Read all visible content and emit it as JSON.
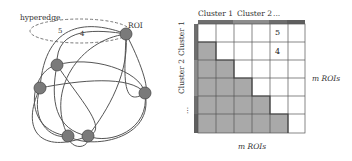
{
  "left_diagram": {
    "hyperedge_label": "hyperedge",
    "roi_label": "ROI",
    "edge_weights": [
      "5",
      "4"
    ],
    "nodes": [
      {
        "id": "roi-top-right",
        "x": 126,
        "y": 34
      },
      {
        "id": "node-upper-left",
        "x": 57,
        "y": 65
      },
      {
        "id": "node-left",
        "x": 40,
        "y": 88
      },
      {
        "id": "node-right",
        "x": 145,
        "y": 93
      },
      {
        "id": "node-bottom-left",
        "x": 68,
        "y": 136
      },
      {
        "id": "node-bottom-right",
        "x": 88,
        "y": 136
      }
    ],
    "colors": {
      "node_fill": "#7a7a7a",
      "edge": "#555555",
      "hyperedge_dash": "#777777"
    }
  },
  "right_diagram": {
    "col_headers": [
      "Cluster 1",
      "Cluster 2",
      "..."
    ],
    "row_headers": [
      "Cluster 1",
      "Cluster 2",
      "..."
    ],
    "x_axis_label": "m ROIs",
    "y_axis_label": "m ROIs",
    "matrix_size": 6,
    "cell_values": [
      {
        "row": 0,
        "col": 4,
        "value": "5"
      },
      {
        "row": 1,
        "col": 4,
        "value": "4"
      }
    ],
    "colors": {
      "lower_triangle": "#a9a9a9",
      "upper_triangle": "#ffffff",
      "grid": "#555555",
      "cluster_bar_1": "#6e6e6e",
      "cluster_bar_2": "#8c8c8c",
      "cluster_bar_3": "#5e5e5e"
    }
  }
}
